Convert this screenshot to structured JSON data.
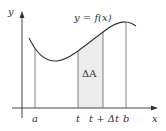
{
  "diagram": {
    "curve_label": "y = f(x)",
    "axis_labels": {
      "x": "x",
      "y": "y"
    },
    "tick_labels": {
      "a": "a",
      "t": "t",
      "t_plus_dt": "t + Δt",
      "b": "b"
    },
    "region_label": "ΔA",
    "colors": {
      "stroke": "#333333",
      "axis": "#444444",
      "shade": "#ececec",
      "guide": "#666666"
    }
  }
}
